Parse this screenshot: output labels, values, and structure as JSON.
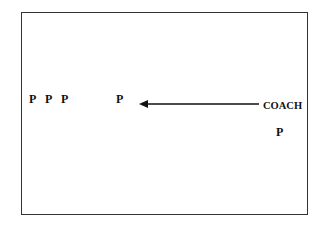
{
  "diagram": {
    "players_left": [
      {
        "label": "P",
        "x": 29,
        "y": 93
      },
      {
        "label": "P",
        "x": 45,
        "y": 93
      },
      {
        "label": "P",
        "x": 61,
        "y": 93
      }
    ],
    "player_center": {
      "label": "P",
      "x": 116,
      "y": 93
    },
    "coach": {
      "label": "COACH",
      "x": 263,
      "y": 101
    },
    "player_right": {
      "label": "P",
      "x": 276,
      "y": 126
    },
    "arrow": {
      "from": "coach",
      "to": "player_center",
      "direction": "left"
    }
  }
}
